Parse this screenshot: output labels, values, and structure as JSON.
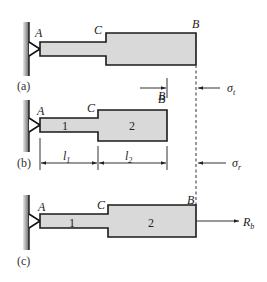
{
  "figure": {
    "panels": [
      {
        "caption": "(a)",
        "points": {
          "A": "A",
          "C": "C",
          "B": "B"
        },
        "annotations": {
          "displacement": "B",
          "stress": "σ",
          "stress_sub": "t"
        }
      },
      {
        "caption": "(b)",
        "points": {
          "A": "A",
          "C": "C",
          "B": "B"
        },
        "segments": [
          "1",
          "2"
        ],
        "dimensions": [
          {
            "symbol": "l",
            "sub": "1"
          },
          {
            "symbol": "l",
            "sub": "2"
          }
        ],
        "annotations": {
          "stress": "σ",
          "stress_sub": "r"
        }
      },
      {
        "caption": "(c)",
        "points": {
          "A": "A",
          "C": "C",
          "B": "B"
        },
        "segments": [
          "1",
          "2"
        ],
        "annotations": {
          "reaction": "R",
          "reaction_sub": "b"
        }
      }
    ],
    "colors": {
      "bar_fill": "#d9d9d9",
      "outline": "#1a1a1a",
      "wall": "#888888"
    }
  }
}
